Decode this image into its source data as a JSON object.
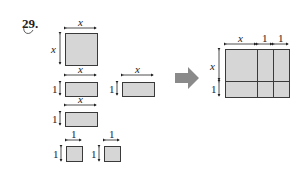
{
  "problem": {
    "number": "29."
  },
  "labels": {
    "x": "x",
    "one": "1"
  },
  "tiles_left": [
    {
      "name": "x-squared-tile",
      "width_label": "x",
      "height_label": "x",
      "count": 1
    },
    {
      "name": "x-by-1-tile",
      "width_label": "x",
      "height_label": "1",
      "count": 3
    },
    {
      "name": "unit-tile",
      "width_label": "1",
      "height_label": "1",
      "count": 2
    }
  ],
  "result_rectangle": {
    "width_labels": [
      "x",
      "1",
      "1"
    ],
    "height_labels": [
      "x",
      "1"
    ]
  },
  "colors": {
    "tile_fill": "#d6d6d6",
    "tile_border": "#3a3a3a",
    "arrow": "#8a8a8a"
  }
}
